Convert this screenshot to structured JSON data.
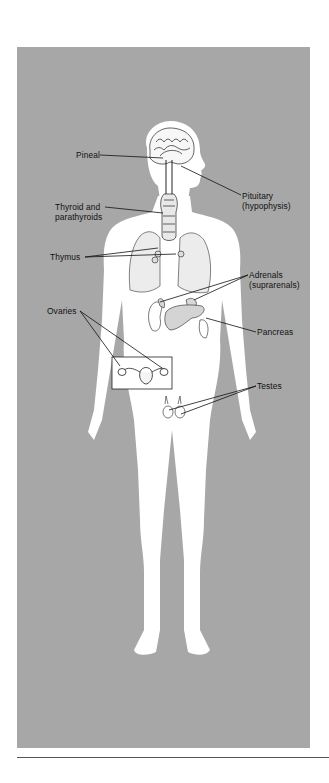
{
  "figure": {
    "background_color": "#a7a7a7",
    "body_color": "#ffffff",
    "labels": [
      {
        "id": "pineal",
        "text": "Pineal"
      },
      {
        "id": "pituitary",
        "line1": "Pituitary",
        "line2": "(hypophysis)"
      },
      {
        "id": "thyroid",
        "line1": "Thyroid and",
        "line2": "parathyroids"
      },
      {
        "id": "thymus",
        "text": "Thymus"
      },
      {
        "id": "adrenals",
        "line1": "Adrenals",
        "line2": "(suprarenals)"
      },
      {
        "id": "pancreas",
        "text": "Pancreas"
      },
      {
        "id": "ovaries",
        "text": "Ovaries"
      },
      {
        "id": "testes",
        "text": "Testes"
      }
    ]
  }
}
